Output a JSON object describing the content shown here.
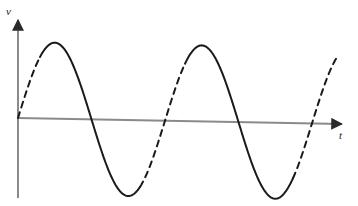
{
  "figure": {
    "title": "",
    "background_color": "#ffffff",
    "width": 358,
    "height": 206
  },
  "axes": {
    "y_axis": {
      "label": "v",
      "label_style": "italic",
      "color": "#808080",
      "x": 18,
      "y_top": 18,
      "y_bottom": 198,
      "arrowhead": "up"
    },
    "x_axis": {
      "label": "t",
      "label_style": "italic",
      "color": "#808080",
      "x_start": 18,
      "y_start": 118,
      "x_end": 345,
      "y_end": 124,
      "arrowhead": "right"
    }
  },
  "chart_data": {
    "type": "line",
    "title": "",
    "xlabel": "t",
    "ylabel": "v",
    "grid": false,
    "legend": null,
    "curve": {
      "name": "voltage-waveform",
      "shape": "sine",
      "color": "#1a1a1a",
      "line_width": 2,
      "amplitude_px": 76,
      "period_px": 147,
      "baseline_y_px": 118,
      "phase": 0,
      "x_start_px": 18,
      "x_end_px": 337,
      "cycles": 2.17,
      "segments": [
        {
          "style": "dashed",
          "from_x": 18,
          "to_x": 40,
          "note": "rising from origin"
        },
        {
          "style": "solid",
          "from_x": 40,
          "to_x": 140,
          "note": "first peak through first trough"
        },
        {
          "style": "dashed",
          "from_x": 140,
          "to_x": 185,
          "note": "rising through axis"
        },
        {
          "style": "solid",
          "from_x": 185,
          "to_x": 293,
          "note": "second peak through second trough"
        },
        {
          "style": "dashed",
          "from_x": 293,
          "to_x": 337,
          "note": "final rising tail"
        }
      ],
      "dash_pattern": "6 5"
    },
    "features": {
      "peaks": [
        {
          "x_px": 55,
          "y_px": 42
        },
        {
          "x_px": 201,
          "y_px": 43
        }
      ],
      "troughs": [
        {
          "x_px": 128,
          "y_px": 192
        },
        {
          "x_px": 274,
          "y_px": 194
        }
      ],
      "zero_crossings_px": [
        18,
        92,
        165,
        238,
        311
      ]
    },
    "x": [
      0,
      0.25,
      0.5,
      0.75,
      1,
      1.25,
      1.5,
      1.75,
      2,
      2.17
    ],
    "y": [
      0,
      1,
      0,
      -1,
      0,
      1,
      0,
      -1,
      0,
      0.55
    ],
    "xlim": [
      0,
      2.17
    ],
    "ylim": [
      -1.05,
      1.05
    ]
  }
}
